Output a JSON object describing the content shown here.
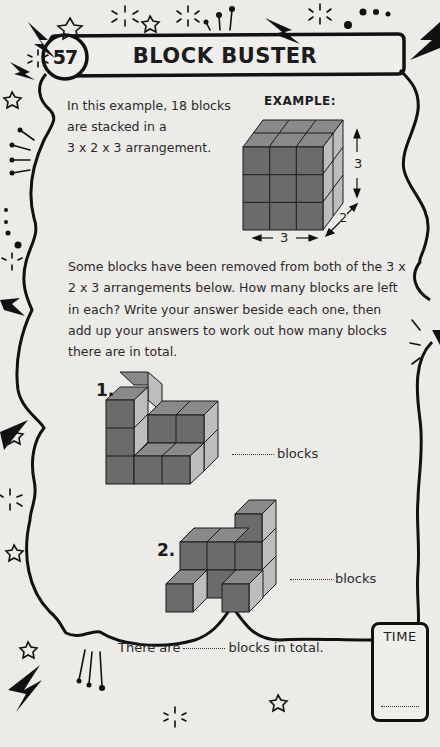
{
  "header": {
    "puzzle_number": "57",
    "title": "BLOCK BUSTER"
  },
  "intro": {
    "line1": "In this example, 18 blocks",
    "line2": "are stacked in a",
    "line3": "3 x 2 x 3 arrangement."
  },
  "example": {
    "label": "EXAMPLE:",
    "dims": {
      "width": "3",
      "depth": "2",
      "height": "3"
    },
    "block_count": 18
  },
  "instructions": "Some blocks have been removed from both of the 3 x 2 x 3 arrangements below. How many blocks are left in each? Write your answer beside each one, then add up your answers to work out how many blocks there are in total.",
  "questions": [
    {
      "number": "1.",
      "answer_suffix": "blocks",
      "answer_value": ""
    },
    {
      "number": "2.",
      "answer_suffix": "blocks",
      "answer_value": ""
    }
  ],
  "total": {
    "prefix": "There are",
    "suffix": "blocks in total.",
    "answer_value": ""
  },
  "timer": {
    "label": "TIME",
    "icon": "stopwatch-icon",
    "value": ""
  },
  "colors": {
    "background": "#ecebe8",
    "outline": "#111111",
    "block_front": "#6b6b6b",
    "block_top": "#8a8a8a",
    "block_side": "#bdbdbd"
  }
}
